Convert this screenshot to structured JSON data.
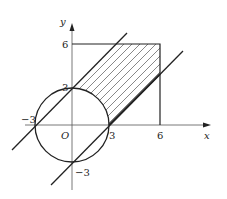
{
  "diagram": {
    "type": "coordinate-geometry",
    "axes": {
      "x_label": "x",
      "y_label": "y",
      "origin_label": "O"
    },
    "tick_labels": {
      "x_pos3": "3",
      "x_pos6": "6",
      "x_neg3": "−3",
      "y_pos3": "3",
      "y_pos6": "6",
      "y_neg3": "−3"
    },
    "shapes": {
      "circle": {
        "center": [
          0,
          0
        ],
        "radius": 3
      },
      "line_upper": {
        "equation": "y = x + 3"
      },
      "line_lower": {
        "equation": "y = x - 3"
      },
      "square": {
        "x_range": [
          0,
          6
        ],
        "y_range": [
          0,
          6
        ]
      },
      "hatched_region": "between lines, outside circle, within square"
    },
    "colors": {
      "stroke": "#222222",
      "hatch": "#555555",
      "background": "#ffffff"
    }
  }
}
